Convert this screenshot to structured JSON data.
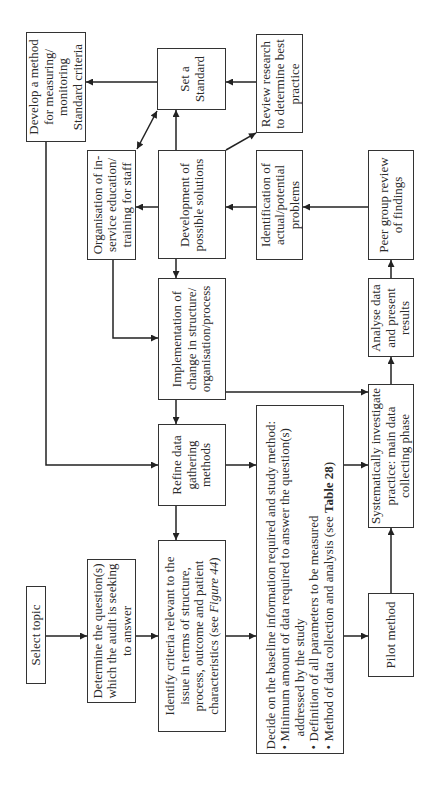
{
  "diagram": {
    "boxes": {
      "develop_method": {
        "lines": [
          "Develop a method",
          "for measuring/",
          "monitoring",
          "Standard criteria"
        ]
      },
      "set_standard": {
        "lines": [
          "Set a",
          "Standard"
        ]
      },
      "review_research": {
        "lines": [
          "Review research",
          "to determine best",
          "practice"
        ]
      },
      "organisation_education": {
        "lines": [
          "Organisation of in-",
          "service education/",
          "training for staff"
        ]
      },
      "development_solutions": {
        "lines": [
          "Development of",
          "possible solutions"
        ]
      },
      "identification_problems": {
        "lines": [
          "Identification of",
          "actual/potential",
          "problems"
        ]
      },
      "peer_review": {
        "lines": [
          "Peer group review",
          "of findings"
        ]
      },
      "implementation_change": {
        "lines": [
          "Implementation of",
          "change in structure/",
          "organisation/process"
        ]
      },
      "analyse_data": {
        "lines": [
          "Analyse data",
          "and present",
          "results"
        ]
      },
      "refine_methods": {
        "lines": [
          "Refine data",
          "gathering",
          "methods"
        ]
      },
      "systematically_investigate": {
        "lines": [
          "Systematically investigate",
          "practice: main data",
          "collecting phase"
        ]
      },
      "decide_baseline": {
        "heading": "Decide on the baseline information required and study method:",
        "bullet_symbol": "•",
        "bullets": [
          {
            "lines": [
              "Minimum amount of data required to answer the question(s)",
              "addressed by the study"
            ]
          },
          {
            "lines": [
              "Definition of all parameters to be measured"
            ]
          },
          {
            "prefix": "Method of data collection and analysis (see ",
            "ref": "Table 28",
            "suffix": ")"
          }
        ]
      },
      "identify_criteria": {
        "lines": [
          "Identify criteria relevant to the",
          "issue in terms of structure,",
          "process, outcome and patient"
        ],
        "last_line": {
          "prefix": "characteristics (see ",
          "ref": "Figure 44",
          "suffix": ")"
        }
      },
      "select_topic": {
        "lines": [
          "Select topic"
        ]
      },
      "determine_questions": {
        "lines": [
          "Determine the question(s)",
          "which the audit is seeking",
          "to answer"
        ]
      },
      "pilot_method": {
        "lines": [
          "Pilot method"
        ]
      }
    }
  }
}
